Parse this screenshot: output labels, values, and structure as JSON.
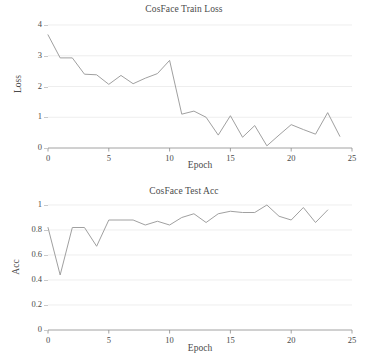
{
  "figure": {
    "background": "#ffffff",
    "line_color": "#a0a0a0",
    "grid_color": "#e6e6e6",
    "axis_color": "#8a8a8a",
    "text_color": "#4a4a4a"
  },
  "chart_data": [
    {
      "type": "line",
      "title": "CosFace Train Loss",
      "xlabel": "Epoch",
      "ylabel": "Loss",
      "xlim": [
        0,
        25
      ],
      "ylim": [
        0,
        4
      ],
      "grid": true,
      "legend": "none",
      "xticks": [
        0,
        5,
        10,
        15,
        20,
        25
      ],
      "xtick_labels": [
        "0",
        "5",
        "10",
        "15",
        "20",
        "25"
      ],
      "yticks": [
        0,
        1,
        2,
        3,
        4
      ],
      "ytick_labels": [
        "0",
        "1",
        "2",
        "3",
        "4"
      ],
      "x": [
        0,
        1,
        2,
        3,
        4,
        5,
        6,
        7,
        8,
        9,
        10,
        11,
        12,
        13,
        14,
        15,
        16,
        17,
        18,
        19,
        20,
        21,
        22,
        23,
        24
      ],
      "values": [
        3.68,
        2.93,
        2.93,
        2.4,
        2.38,
        2.07,
        2.36,
        2.09,
        2.27,
        2.42,
        2.85,
        1.1,
        1.2,
        1.0,
        0.42,
        1.05,
        0.35,
        0.73,
        0.07,
        0.42,
        0.76,
        0.6,
        0.45,
        1.15,
        0.38
      ]
    },
    {
      "type": "line",
      "title": "CosFace Test Acc",
      "xlabel": "Epoch",
      "ylabel": "Acc",
      "xlim": [
        0,
        25
      ],
      "ylim": [
        0,
        1
      ],
      "grid": true,
      "legend": "none",
      "xticks": [
        0,
        5,
        10,
        15,
        20,
        25
      ],
      "xtick_labels": [
        "0",
        "5",
        "10",
        "15",
        "20",
        "25"
      ],
      "yticks": [
        0,
        0.2,
        0.4,
        0.6,
        0.8,
        1
      ],
      "ytick_labels": [
        "0",
        "0.2",
        "0.4",
        "0.6",
        "0.8",
        "1"
      ],
      "x": [
        0,
        1,
        2,
        3,
        4,
        5,
        6,
        7,
        8,
        9,
        10,
        11,
        12,
        13,
        14,
        15,
        16,
        17,
        18,
        19,
        20,
        21,
        22,
        23
      ],
      "values": [
        0.82,
        0.44,
        0.82,
        0.82,
        0.67,
        0.88,
        0.88,
        0.88,
        0.84,
        0.87,
        0.84,
        0.9,
        0.93,
        0.86,
        0.93,
        0.95,
        0.94,
        0.94,
        1.0,
        0.91,
        0.88,
        0.98,
        0.86,
        0.96
      ]
    }
  ]
}
